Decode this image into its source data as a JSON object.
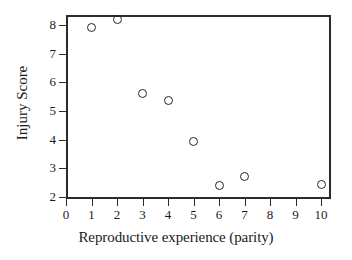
{
  "chart_data": {
    "type": "scatter",
    "title": "",
    "xlabel": "Reproductive experience (parity)",
    "ylabel": "Injury Score",
    "xlim": [
      0,
      10.4
    ],
    "ylim": [
      2,
      8.5
    ],
    "grid": false,
    "legend": null,
    "marker": "open-circle",
    "marker_color": "#262626",
    "x": [
      1,
      2,
      3,
      4,
      5,
      6,
      7,
      10
    ],
    "y": [
      7.9,
      8.2,
      5.6,
      5.35,
      3.95,
      2.4,
      2.7,
      2.45
    ],
    "points": [
      {
        "x": 1,
        "y": 7.9
      },
      {
        "x": 2,
        "y": 8.2
      },
      {
        "x": 3,
        "y": 5.6
      },
      {
        "x": 4,
        "y": 5.35
      },
      {
        "x": 5,
        "y": 3.95
      },
      {
        "x": 6,
        "y": 2.4
      },
      {
        "x": 7,
        "y": 2.7
      },
      {
        "x": 10,
        "y": 2.45
      }
    ],
    "xticks": [
      0,
      1,
      2,
      3,
      4,
      5,
      6,
      7,
      8,
      9,
      10
    ],
    "xticklabels": [
      "0",
      "1",
      "2",
      "3",
      "4",
      "5",
      "6",
      "7",
      "8",
      "9",
      "10"
    ],
    "yticks": [
      2,
      3,
      4,
      5,
      6,
      7,
      8
    ],
    "yticklabels": [
      "2",
      "3",
      "4",
      "5",
      "6",
      "7",
      "8"
    ]
  },
  "figure": {
    "background": "#ffffff",
    "frame_color": "#2b2b2b"
  }
}
